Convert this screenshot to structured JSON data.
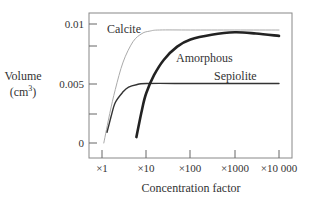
{
  "chart_data": {
    "type": "line",
    "title": "",
    "xlabel": "Concentration factor",
    "ylabel": "Volume",
    "ylabel_unit": "(cm³)",
    "xscale": "log",
    "x_ticks": [
      "×1",
      "×10",
      "×100",
      "×1000",
      "×10 000"
    ],
    "y_ticks": [
      "0",
      "0.005",
      "0.01"
    ],
    "ylim": [
      0,
      0.0105
    ],
    "xlim": [
      1,
      10000
    ],
    "grid": false,
    "legend": "inline labels",
    "series": [
      {
        "name": "Calcite",
        "color": "#aaaaaa",
        "width": 1,
        "x": [
          1.1,
          1.5,
          2,
          3,
          5,
          8,
          12,
          20,
          100,
          1000,
          10000
        ],
        "y": [
          0.0,
          0.0025,
          0.0045,
          0.0068,
          0.0085,
          0.0092,
          0.0094,
          0.0095,
          0.0095,
          0.0095,
          0.0095
        ]
      },
      {
        "name": "Sepiolite",
        "color": "#333333",
        "width": 1.4,
        "x": [
          1.3,
          1.6,
          2,
          3,
          4,
          6,
          10,
          100,
          1000,
          10000
        ],
        "y": [
          0.0009,
          0.0022,
          0.0034,
          0.0043,
          0.0047,
          0.0049,
          0.005,
          0.005,
          0.005,
          0.005
        ]
      },
      {
        "name": "Amorphous",
        "color": "#222222",
        "width": 2.6,
        "x": [
          6,
          8,
          10,
          15,
          25,
          50,
          100,
          300,
          1000,
          3000,
          10000
        ],
        "y": [
          0.0005,
          0.0028,
          0.0042,
          0.0057,
          0.007,
          0.0081,
          0.0087,
          0.0091,
          0.0093,
          0.0092,
          0.009
        ]
      }
    ],
    "annotations": [
      "Calcite",
      "Amorphous",
      "Sepiolite"
    ]
  },
  "labels": {
    "calcite": "Calcite",
    "amorphous": "Amorphous",
    "sepiolite": "Sepiolite",
    "ylabel_line1": "Volume",
    "ylabel_line2": "(cm",
    "ylabel_sup": "3",
    "ylabel_close": ")",
    "xlabel": "Concentration factor",
    "y0": "0",
    "y005": "0.005",
    "y01": "0.01",
    "x1": "×1",
    "x10": "×10",
    "x100": "×100",
    "x1000": "×1000",
    "x10000": "×10 000"
  }
}
